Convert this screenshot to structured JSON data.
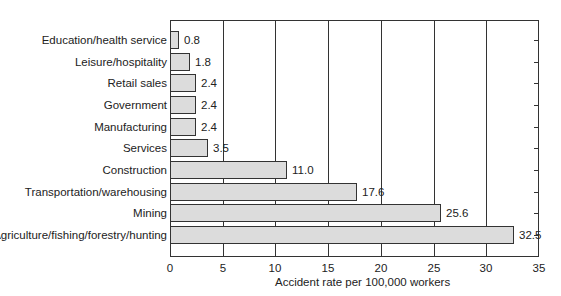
{
  "chart_data": {
    "type": "bar",
    "orientation": "horizontal",
    "title": "",
    "xlabel": "Accident rate per 100,000 workers",
    "ylabel": "",
    "xlim": [
      0,
      35
    ],
    "xticks": [
      0,
      5,
      10,
      15,
      20,
      25,
      30,
      35
    ],
    "grid": "vertical",
    "legend": null,
    "categories": [
      "Education/health service",
      "Leisure/hospitality",
      "Retail sales",
      "Government",
      "Manufacturing",
      "Services",
      "Construction",
      "Transportation/warehousing",
      "Mining",
      "Agriculture/fishing/forestry/hunting"
    ],
    "values": [
      0.8,
      1.8,
      2.4,
      2.4,
      2.4,
      3.5,
      11.0,
      17.6,
      25.6,
      32.5
    ],
    "value_labels": [
      "0.8",
      "1.8",
      "2.4",
      "2.4",
      "2.4",
      "3.5",
      "11.0",
      "17.6",
      "25.6",
      "32.5"
    ],
    "colors": {
      "bar_fill": "#dcdcdc",
      "bar_border": "#333333",
      "grid": "#333333"
    }
  },
  "axis": {
    "tick_labels": [
      "0",
      "5",
      "10",
      "15",
      "20",
      "25",
      "30",
      "35"
    ]
  }
}
